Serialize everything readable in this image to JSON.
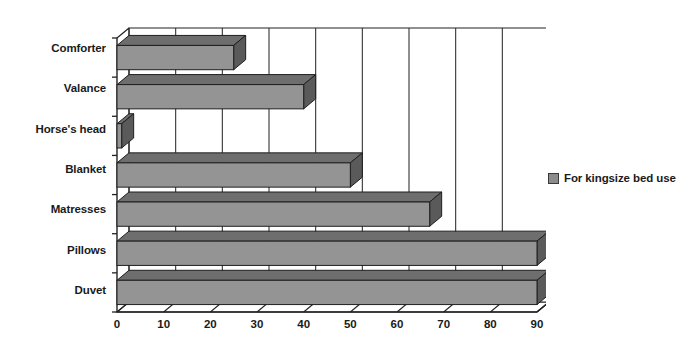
{
  "chart_data": {
    "type": "bar",
    "orientation": "horizontal",
    "style": "3d-bar",
    "title": "",
    "subtitle": "",
    "xlabel": "",
    "ylabel": "",
    "xlim": [
      0,
      90
    ],
    "xticks": [
      0,
      10,
      20,
      30,
      40,
      50,
      60,
      70,
      80,
      90
    ],
    "xtick_labels": [
      "0",
      "10",
      "20",
      "30",
      "40",
      "50",
      "60",
      "70",
      "80",
      "90"
    ],
    "grid": "vertical",
    "legend_position": "right",
    "categories": [
      "Comforter",
      "Valance",
      "Horse's head",
      "Blanket",
      "Matresses",
      "Pillows",
      "Duvet"
    ],
    "series": [
      {
        "name": "For kingsize bed use",
        "values": [
          25,
          40,
          1,
          50,
          67,
          90,
          90
        ],
        "color": "#949494",
        "top_face_color": "#6e6e6e",
        "side_face_color": "#5a5a5a"
      }
    ]
  },
  "legend": {
    "entries": [
      {
        "label": "For kingsize bed use",
        "swatch_color": "#8c8c8c"
      }
    ]
  },
  "axis": {
    "line_color": "#222222",
    "grid_color": "#333333"
  }
}
